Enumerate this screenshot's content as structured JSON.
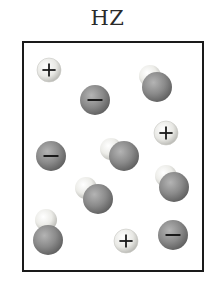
{
  "diagram": {
    "title": "HZ",
    "legend_symbols": {
      "cation": "+",
      "anion": "−"
    },
    "colors": {
      "border": "#1a1a1a",
      "hydrogen_light": "#f2f2ee",
      "hydrogen_dark": "#b9b9b4",
      "z_light": "#a9a9a9",
      "z_dark": "#5d5d5d",
      "cation_light": "#f4f4f0",
      "cation_dark": "#b5b5b0"
    },
    "particles": [
      {
        "type": "cation",
        "label": "+",
        "x": 49,
        "y": 70,
        "r": 12
      },
      {
        "type": "anion",
        "label": "−",
        "x": 95,
        "y": 100,
        "r": 15
      },
      {
        "type": "molecule",
        "label": "HZ",
        "h": {
          "x": 150,
          "y": 76,
          "r": 11
        },
        "z": {
          "x": 157,
          "y": 87,
          "r": 15
        }
      },
      {
        "type": "cation",
        "label": "+",
        "x": 166,
        "y": 133,
        "r": 12
      },
      {
        "type": "anion",
        "label": "−",
        "x": 51,
        "y": 156,
        "r": 15
      },
      {
        "type": "molecule",
        "label": "HZ",
        "h": {
          "x": 111,
          "y": 149,
          "r": 11
        },
        "z": {
          "x": 124,
          "y": 156,
          "r": 15
        }
      },
      {
        "type": "molecule",
        "label": "HZ",
        "h": {
          "x": 166,
          "y": 176,
          "r": 11
        },
        "z": {
          "x": 174,
          "y": 187,
          "r": 15
        }
      },
      {
        "type": "molecule",
        "label": "HZ",
        "h": {
          "x": 86,
          "y": 188,
          "r": 11
        },
        "z": {
          "x": 98,
          "y": 199,
          "r": 15
        }
      },
      {
        "type": "molecule",
        "label": "HZ",
        "h": {
          "x": 46,
          "y": 220,
          "r": 11
        },
        "z": {
          "x": 48,
          "y": 240,
          "r": 15
        }
      },
      {
        "type": "cation",
        "label": "+",
        "x": 126,
        "y": 241,
        "r": 12
      },
      {
        "type": "anion",
        "label": "−",
        "x": 173,
        "y": 235,
        "r": 15
      }
    ],
    "counts": {
      "cations": 3,
      "anions": 3,
      "molecules": 5
    }
  }
}
